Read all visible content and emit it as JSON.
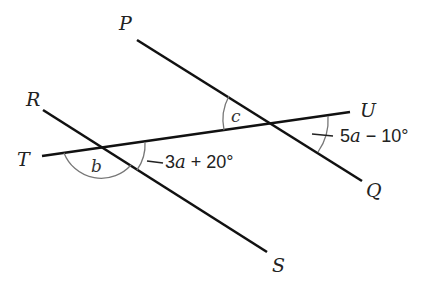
{
  "diagram": {
    "type": "geometry-angles",
    "points": {
      "P": "P",
      "Q": "Q",
      "R": "R",
      "S": "S",
      "T": "T",
      "U": "U"
    },
    "angles": {
      "b": "b",
      "c": "c"
    },
    "expressions": {
      "lower": {
        "coef": "3",
        "var": "a",
        "rest": " + 20°"
      },
      "upper": {
        "coef": "5",
        "var": "a",
        "rest": " − 10°"
      }
    },
    "colors": {
      "line": "#111111",
      "arc": "#777777",
      "background": "#ffffff"
    }
  }
}
